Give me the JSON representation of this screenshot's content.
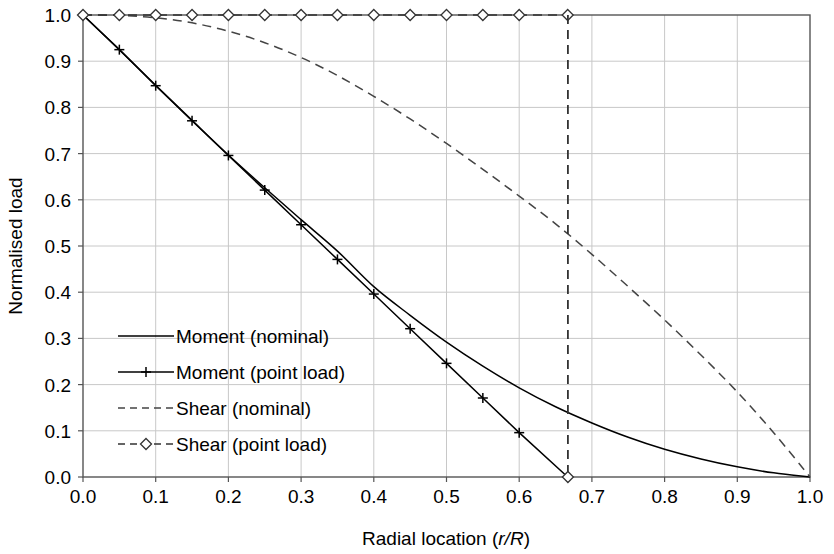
{
  "chart_data": {
    "type": "line",
    "title": "",
    "xlabel": "Radial location (r/R)",
    "ylabel": "Normalised load",
    "xlim": [
      0.0,
      1.0
    ],
    "ylim": [
      0.0,
      1.0
    ],
    "xticks": [
      "0.0",
      "0.1",
      "0.2",
      "0.3",
      "0.4",
      "0.5",
      "0.6",
      "0.7",
      "0.8",
      "0.9",
      "1.0"
    ],
    "yticks": [
      "0.0",
      "0.1",
      "0.2",
      "0.3",
      "0.4",
      "0.5",
      "0.6",
      "0.7",
      "0.8",
      "0.9",
      "1.0"
    ],
    "xtick_values": [
      0.0,
      0.1,
      0.2,
      0.3,
      0.4,
      0.5,
      0.6,
      0.7,
      0.8,
      0.9,
      1.0
    ],
    "ytick_values": [
      0.0,
      0.1,
      0.2,
      0.3,
      0.4,
      0.5,
      0.6,
      0.7,
      0.8,
      0.9,
      1.0
    ],
    "grid": true,
    "grid_color": "#c8c8c8",
    "axis_color": "#555555",
    "legend_position": "inner-left-lower",
    "annotations": [
      {
        "name": "cutoff-line",
        "type": "vertical-dashed",
        "x": 0.667,
        "y_from": 0.0,
        "y_to": 1.0
      }
    ],
    "series": [
      {
        "name": "Moment (nominal)",
        "style": "solid",
        "marker": "none",
        "color": "#000000",
        "x": [
          0.0,
          0.05,
          0.1,
          0.15,
          0.2,
          0.25,
          0.3,
          0.35,
          0.4,
          0.45,
          0.5,
          0.55,
          0.6,
          0.65,
          0.7,
          0.75,
          0.8,
          0.85,
          0.9,
          0.95,
          1.0
        ],
        "y": [
          1.0,
          0.925,
          0.848,
          0.772,
          0.697,
          0.626,
          0.557,
          0.489,
          0.412,
          0.35,
          0.292,
          0.24,
          0.193,
          0.152,
          0.117,
          0.086,
          0.06,
          0.039,
          0.022,
          0.009,
          0.0
        ]
      },
      {
        "name": "Moment (point load)",
        "style": "solid",
        "marker": "plus",
        "color": "#000000",
        "x": [
          0.0,
          0.05,
          0.1,
          0.15,
          0.2,
          0.25,
          0.3,
          0.35,
          0.4,
          0.45,
          0.5,
          0.55,
          0.6,
          0.6667
        ],
        "y": [
          1.0,
          0.925,
          0.847,
          0.771,
          0.696,
          0.621,
          0.546,
          0.471,
          0.396,
          0.321,
          0.246,
          0.171,
          0.096,
          0.0
        ]
      },
      {
        "name": "Shear (nominal)",
        "style": "dashed",
        "marker": "none",
        "color": "#444444",
        "x": [
          0.0,
          0.05,
          0.1,
          0.15,
          0.2,
          0.25,
          0.3,
          0.35,
          0.4,
          0.45,
          0.5,
          0.55,
          0.6,
          0.65,
          0.7,
          0.75,
          0.8,
          0.85,
          0.9,
          0.95,
          1.0
        ],
        "y": [
          1.0,
          0.999,
          0.994,
          0.983,
          0.965,
          0.94,
          0.908,
          0.869,
          0.824,
          0.775,
          0.722,
          0.666,
          0.608,
          0.548,
          0.482,
          0.412,
          0.34,
          0.264,
          0.184,
          0.096,
          0.0
        ]
      },
      {
        "name": "Shear (point load)",
        "style": "dashed",
        "marker": "diamond",
        "color": "#333333",
        "x": [
          0.0,
          0.05,
          0.1,
          0.15,
          0.2,
          0.25,
          0.3,
          0.35,
          0.4,
          0.45,
          0.5,
          0.55,
          0.6,
          0.6667
        ],
        "y": [
          1.0,
          1.0,
          1.0,
          1.0,
          1.0,
          1.0,
          1.0,
          1.0,
          1.0,
          1.0,
          1.0,
          1.0,
          1.0,
          1.0
        ]
      }
    ]
  },
  "legend": {
    "items": [
      {
        "label": "Moment (nominal)",
        "key": "moment-nominal"
      },
      {
        "label": "Moment (point load)",
        "key": "moment-point-load"
      },
      {
        "label": "Shear (nominal)",
        "key": "shear-nominal"
      },
      {
        "label": "Shear (point load)",
        "key": "shear-point-load"
      }
    ]
  },
  "axis": {
    "x_title_main": "Radial location (",
    "x_title_italic": "r/R",
    "x_title_tail": ")",
    "y_title": "Normalised load"
  }
}
